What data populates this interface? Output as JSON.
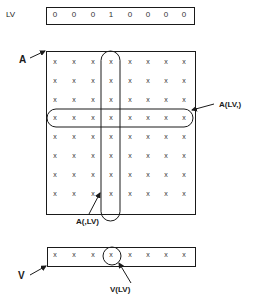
{
  "lv": {
    "label": "LV",
    "values": [
      "0",
      "0",
      "0",
      "1",
      "0",
      "0",
      "0",
      "0"
    ]
  },
  "matrix": {
    "label": "A",
    "rows": 8,
    "cols": 8,
    "cell_symbol": "x",
    "selected_row_index": 3,
    "selected_col_index": 3,
    "row_selection_label": "A(LV,)",
    "col_selection_label": "A(,LV)"
  },
  "vector": {
    "label": "V",
    "length": 8,
    "cell_symbol": "x",
    "selected_index": 3,
    "selection_label": "V(LV)"
  }
}
